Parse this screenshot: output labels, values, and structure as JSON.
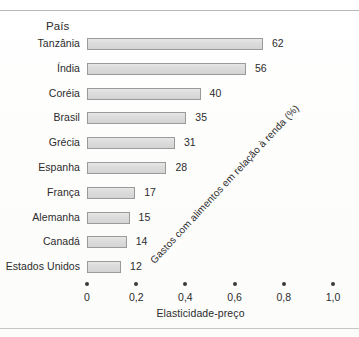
{
  "chart_data": {
    "type": "bar",
    "orientation": "horizontal",
    "title": "",
    "column_header": "País",
    "categories": [
      "Tanzânia",
      "Índia",
      "Coréia",
      "Brasil",
      "Grécia",
      "Espanha",
      "França",
      "Alemanha",
      "Canadá",
      "Estados Unidos"
    ],
    "values": [
      62,
      56,
      40,
      35,
      31,
      28,
      17,
      15,
      14,
      12
    ],
    "value_label": "Gastos com alimentos em relação à renda (%)",
    "xlabel": "Elasticidade-preço",
    "ylabel": "País",
    "x_ticks": [
      "0",
      "0,2",
      "0,4",
      "0,6",
      "0,8",
      "1,0"
    ],
    "x_tick_values": [
      0,
      0.2,
      0.4,
      0.6,
      0.8,
      1.0
    ],
    "xlim": [
      0,
      1.0
    ],
    "grid": false,
    "legend": "none",
    "bar_fill_color": "#dcdcdc",
    "bar_border_color": "#9a9a9a",
    "text_color": "#2b2b2b"
  },
  "figure": {
    "background": "#fefefe",
    "rule_color": "#b9b9b9"
  }
}
